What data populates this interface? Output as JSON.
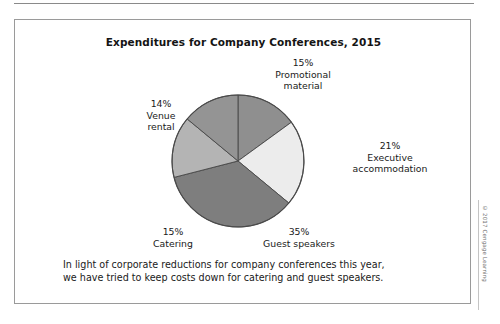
{
  "figure": {
    "title": "Expenditures for Company Conferences, 2015",
    "caption_line_1": "In light of corporate reductions for company conferences this year,",
    "caption_line_2": "we have tried to keep costs down for catering and guest speakers.",
    "credit": "© 2017 Cengage Learning"
  },
  "labels": {
    "promotional": {
      "percent": "15%",
      "name_line_1": "Promotional",
      "name_line_2": "material"
    },
    "executive": {
      "percent": "21%",
      "name_line_1": "Executive",
      "name_line_2": "accommodation"
    },
    "guest": {
      "percent": "35%",
      "name_line_1": "Guest speakers"
    },
    "catering": {
      "percent": "15%",
      "name_line_1": "Catering"
    },
    "venue": {
      "percent": "14%",
      "name_line_1": "Venue",
      "name_line_2": "rental"
    }
  },
  "chart_data": {
    "type": "pie",
    "title": "Expenditures for Company Conferences, 2015",
    "xlabel": "",
    "ylabel": "",
    "legend_position": "none",
    "grid": false,
    "start_angle_deg": 0,
    "direction": "clockwise",
    "categories": [
      "Promotional material",
      "Executive accommodation",
      "Guest speakers",
      "Catering",
      "Venue rental"
    ],
    "values": [
      15,
      21,
      35,
      15,
      14
    ],
    "value_labels": [
      "15%",
      "21%",
      "35%",
      "15%",
      "14%"
    ],
    "colors": [
      "#8f8f8f",
      "#ececec",
      "#7e7e7e",
      "#b4b4b4",
      "#949494"
    ],
    "stroke": "#4a4a4a",
    "units": "percent",
    "total": 100
  }
}
